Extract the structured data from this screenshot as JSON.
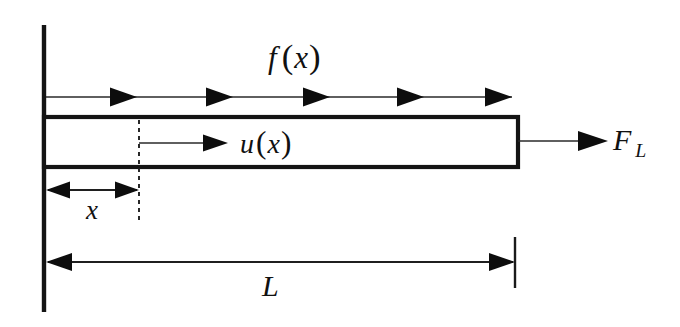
{
  "figure": {
    "background_color": "#ffffff",
    "ink_color": "#111111",
    "width": 680,
    "height": 327
  },
  "labels": {
    "distributed_load": {
      "symbol": "f",
      "arg": "x",
      "open": "(",
      "close": ")",
      "full": "f (x)"
    },
    "displacement": {
      "symbol": "u",
      "arg": "x",
      "open": "(",
      "close": ")",
      "full": "u(x)"
    },
    "end_force": {
      "symbol": "F",
      "subscript": "L",
      "full": "F_L"
    },
    "coordinate": {
      "symbol": "x",
      "full": "x"
    },
    "length": {
      "symbol": "L",
      "full": "L"
    }
  },
  "geometry": {
    "wall": {
      "x": 44,
      "y_top": 25,
      "y_bottom": 312
    },
    "bar": {
      "x_left": 44,
      "x_right": 518,
      "y_top": 117,
      "y_bottom": 167
    },
    "load_row": {
      "y": 97,
      "x_start": 46,
      "x_end": 512,
      "arrow_count": 5,
      "arrow_tips": [
        137,
        233,
        330,
        424,
        512
      ]
    },
    "displacement_arrow": {
      "y": 143,
      "x_start": 139,
      "x_tip": 222
    },
    "end_force_arrow": {
      "y": 141,
      "x_start": 518,
      "x_tip": 608
    },
    "section_dash": {
      "x": 139,
      "y_top": 120,
      "y_bottom": 222
    },
    "x_dimension": {
      "y": 190,
      "x_left": 46,
      "x_right": 139
    },
    "length_dimension": {
      "y": 262,
      "x_left": 46,
      "x_right": 515,
      "tick_top": 237,
      "tick_bottom": 288
    }
  },
  "label_positions": {
    "distributed_load": {
      "x": 268,
      "y": 68
    },
    "displacement": {
      "x": 240,
      "y": 153
    },
    "end_force": {
      "x": 613,
      "y": 150
    },
    "coordinate": {
      "x": 86,
      "y": 219
    },
    "length": {
      "x": 262,
      "y": 296
    }
  },
  "arrow_style": {
    "head_length": 27,
    "head_half_height": 9.5,
    "dim_head_length": 20,
    "dim_head_half_height": 7.5
  }
}
